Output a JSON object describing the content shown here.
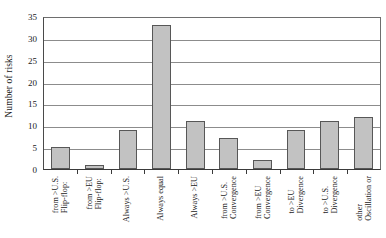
{
  "chart_data": {
    "type": "bar",
    "title": "",
    "xlabel": "",
    "ylabel": "Number of risks",
    "ylim": [
      0,
      35
    ],
    "ytick_step": 5,
    "yticks": [
      0,
      5,
      10,
      15,
      20,
      25,
      30,
      35
    ],
    "grid": true,
    "legend": "none",
    "bar_color": "#c2c2c2",
    "bar_edge_color": "#575757",
    "categories": [
      "Flip-flop: from >U.S.",
      "Flip-flop: from >EU",
      "Always >U.S.",
      "Always equal",
      "Always >EU",
      "Convergence from >U.S.",
      "Convergence from >EU",
      "Divergence to >EU",
      "Divergence to >U.S.",
      "Oscillation or other"
    ],
    "category_lines": [
      [
        "Flip-flop:",
        "from >U.S."
      ],
      [
        "Flip-flop:",
        "from >EU"
      ],
      [
        "Always >U.S.",
        ""
      ],
      [
        "Always equal",
        ""
      ],
      [
        "Always >EU",
        ""
      ],
      [
        "Convergence",
        "from >U.S."
      ],
      [
        "Convergence",
        "from >EU"
      ],
      [
        "Divergence",
        "to >EU"
      ],
      [
        "Divergence",
        "to >U.S."
      ],
      [
        "Oscillation or",
        "other"
      ]
    ],
    "values": [
      5,
      1,
      9,
      33,
      11,
      7,
      2,
      9,
      11,
      12
    ]
  }
}
